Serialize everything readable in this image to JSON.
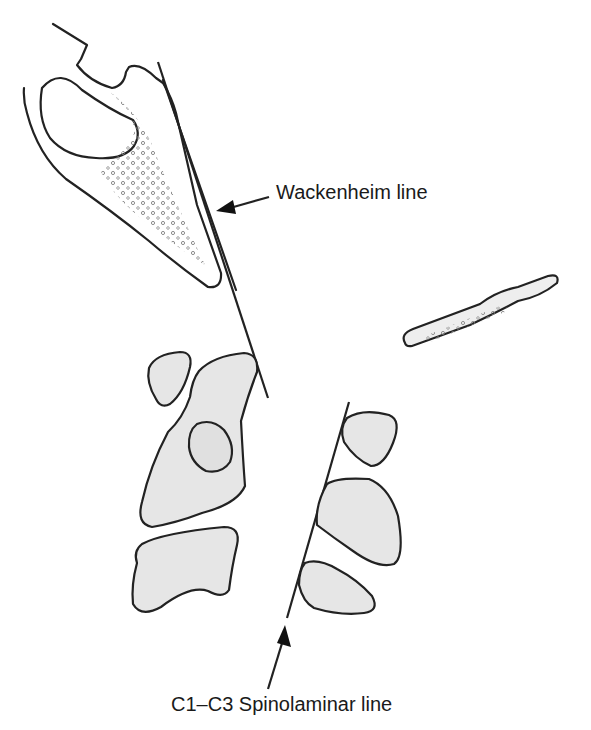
{
  "labels": {
    "wackenheim": "Wackenheim line",
    "spinolaminar": "C1–C3 Spinolaminar line"
  },
  "colors": {
    "stroke": "#222222",
    "bone_fill": "#e6e6e6",
    "background": "#ffffff"
  }
}
